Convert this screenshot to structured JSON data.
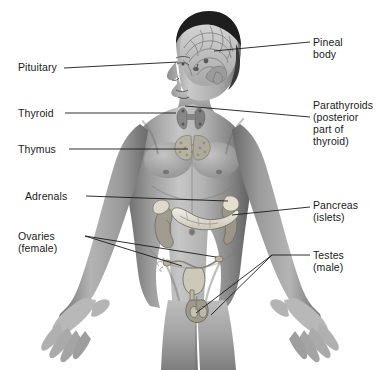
{
  "figure": {
    "width": 388,
    "height": 370,
    "background_color": "#ffffff",
    "line_color": "#1a1a1a",
    "text_color": "#1a1a1a"
  },
  "labels": {
    "pituitary": {
      "text": "Pituitary",
      "side": "left",
      "x": 18,
      "y": 61,
      "leader": [
        [
          64,
          68
        ],
        [
          178,
          62
        ]
      ]
    },
    "pineal_body": {
      "text": "Pineal\nbody",
      "side": "right",
      "x": 313,
      "y": 36,
      "leader": [
        [
          310,
          42
        ],
        [
          214,
          51
        ]
      ]
    },
    "thyroid": {
      "text": "Thyroid",
      "side": "left",
      "x": 18,
      "y": 107,
      "leader": [
        [
          65,
          113
        ],
        [
          176,
          113
        ]
      ]
    },
    "parathyroids": {
      "text": "Parathyroids\n(posterior\npart of\nthyroid)",
      "side": "right",
      "x": 313,
      "y": 99,
      "leader": [
        [
          310,
          117
        ],
        [
          185,
          106
        ]
      ]
    },
    "thymus": {
      "text": "Thymus",
      "side": "left",
      "x": 18,
      "y": 143,
      "leader": [
        [
          69,
          149
        ],
        [
          188,
          149
        ]
      ]
    },
    "adrenals": {
      "text": "Adrenals",
      "side": "left",
      "x": 25,
      "y": 190,
      "leader": [
        [
          86,
          196
        ],
        [
          228,
          201
        ]
      ]
    },
    "pancreas": {
      "text": "Pancreas\n(islets)",
      "side": "right",
      "x": 313,
      "y": 199,
      "leader": [
        [
          310,
          207
        ],
        [
          232,
          215
        ]
      ]
    },
    "ovaries": {
      "text": "Ovaries\n(female)",
      "side": "left",
      "x": 18,
      "y": 230,
      "leader_vertex": [
        85,
        236
      ],
      "leader_a": [
        [
          85,
          236
        ],
        [
          182,
          266
        ]
      ],
      "leader_b": [
        [
          85,
          236
        ],
        [
          215,
          257
        ]
      ]
    },
    "testes": {
      "text": "Testes\n(male)",
      "side": "right",
      "x": 313,
      "y": 249,
      "leader_vertex": [
        272,
        255
      ],
      "leader_c": [
        [
          310,
          255
        ],
        [
          272,
          255
        ]
      ],
      "leader_d": [
        [
          272,
          255
        ],
        [
          196,
          312
        ]
      ],
      "leader_e": [
        [
          272,
          255
        ],
        [
          212,
          314
        ]
      ]
    }
  },
  "organs": [
    {
      "name": "brain-cerebrum",
      "note": "sagittal brain section visible in head"
    },
    {
      "name": "pineal-body",
      "note": "small gland deep in brain"
    },
    {
      "name": "pituitary-gland",
      "note": "at base of brain"
    },
    {
      "name": "thyroid-gland",
      "note": "butterfly gland at throat"
    },
    {
      "name": "parathyroid-glands",
      "note": "posterior to thyroid"
    },
    {
      "name": "thymus-gland",
      "note": "lobed gland behind sternum"
    },
    {
      "name": "adrenal-glands",
      "note": "caps atop both kidneys"
    },
    {
      "name": "kidneys",
      "note": "bean-shaped, flanking spine"
    },
    {
      "name": "pancreas",
      "note": "islets of Langerhans"
    },
    {
      "name": "uterus-ovaries",
      "note": "female reproductive organs"
    },
    {
      "name": "testes",
      "note": "male reproductive organs"
    }
  ]
}
